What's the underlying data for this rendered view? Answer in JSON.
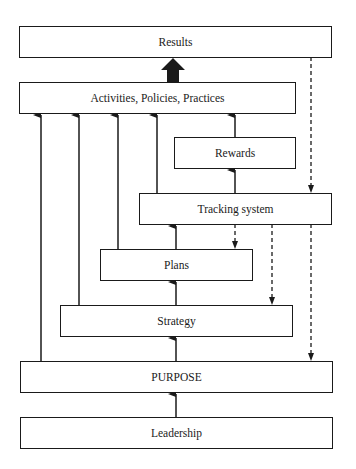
{
  "diagram": {
    "boxes": {
      "results": "Results",
      "activities": "Activities, Policies, Practices",
      "rewards": "Rewards",
      "tracking": "Tracking system",
      "plans": "Plans",
      "strategy": "Strategy",
      "purpose": "PURPOSE",
      "leadership": "Leadership"
    },
    "connections": [
      {
        "from": "activities",
        "to": "results",
        "style": "thick-arrow"
      },
      {
        "from": "rewards",
        "to": "activities",
        "style": "solid"
      },
      {
        "from": "tracking",
        "to": "activities",
        "style": "solid"
      },
      {
        "from": "plans",
        "to": "activities",
        "style": "solid"
      },
      {
        "from": "strategy",
        "to": "activities",
        "style": "solid"
      },
      {
        "from": "purpose",
        "to": "activities",
        "style": "solid"
      },
      {
        "from": "tracking",
        "to": "rewards",
        "style": "solid"
      },
      {
        "from": "results",
        "to": "tracking",
        "style": "dashed"
      },
      {
        "from": "results",
        "to": "purpose",
        "style": "dashed"
      },
      {
        "from": "plans",
        "to": "tracking",
        "style": "solid"
      },
      {
        "from": "tracking",
        "to": "plans",
        "style": "dashed"
      },
      {
        "from": "tracking",
        "to": "strategy",
        "style": "dashed"
      },
      {
        "from": "strategy",
        "to": "plans",
        "style": "solid"
      },
      {
        "from": "purpose",
        "to": "strategy",
        "style": "solid"
      },
      {
        "from": "leadership",
        "to": "purpose",
        "style": "solid"
      }
    ],
    "colors": {
      "line": "#1a1a1a",
      "background": "#ffffff"
    }
  }
}
